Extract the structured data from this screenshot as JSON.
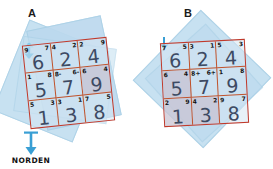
{
  "figure": {
    "background": "#ffffff",
    "grid_line_color": "#c0392b",
    "big_digit_color": "#3d4a63",
    "overlay_color": "#c3dff0",
    "compass": {
      "label": "NORDEN",
      "icon": "north-arrow-icon",
      "color": "#3a9fd4"
    }
  },
  "panels": [
    {
      "id": "A",
      "label": "A",
      "arrow_icon": "north-arrow-icon",
      "rotation_deg": -6,
      "grid": {
        "rows": [
          [
            {
              "big": "6",
              "corner_left": "9",
              "corner_right": "7"
            },
            {
              "big": "2",
              "corner_left": "4",
              "corner_right": "2"
            },
            {
              "big": "4",
              "corner_left": "2",
              "corner_right": "9"
            }
          ],
          [
            {
              "big": "5",
              "corner_left": "1",
              "corner_right": "8"
            },
            {
              "big": "7",
              "corner_left": "8-",
              "corner_right": "6-"
            },
            {
              "big": "9",
              "corner_left": "6",
              "corner_right": "4"
            }
          ],
          [
            {
              "big": "1",
              "corner_left": "5",
              "corner_right": "3"
            },
            {
              "big": "3",
              "corner_left": "3",
              "corner_right": "1"
            },
            {
              "big": "8",
              "corner_left": "7",
              "corner_right": "5"
            }
          ]
        ]
      }
    },
    {
      "id": "B",
      "label": "B",
      "arrow_icon": "north-arrow-icon",
      "rotation_deg": -3,
      "grid": {
        "rows": [
          [
            {
              "big": "6",
              "corner_left": "7",
              "corner_right": "5"
            },
            {
              "big": "2",
              "corner_left": "3",
              "corner_right": "1"
            },
            {
              "big": "4",
              "corner_left": "5",
              "corner_right": "3"
            }
          ],
          [
            {
              "big": "5",
              "corner_left": "6",
              "corner_right": "4"
            },
            {
              "big": "7",
              "corner_left": "8+",
              "corner_right": "6+"
            },
            {
              "big": "9",
              "corner_left": "1",
              "corner_right": "8"
            }
          ],
          [
            {
              "big": "1",
              "corner_left": "2",
              "corner_right": "9"
            },
            {
              "big": "3",
              "corner_left": "4",
              "corner_right": "2"
            },
            {
              "big": "8",
              "corner_left": "9",
              "corner_right": "7"
            }
          ]
        ]
      }
    }
  ]
}
